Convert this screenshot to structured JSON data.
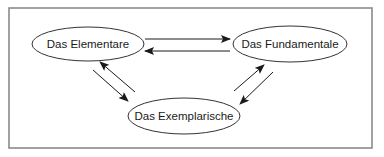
{
  "diagram": {
    "frame": {
      "x": 9,
      "y": 8,
      "width": 363,
      "height": 140,
      "stroke": "#8a8a8a"
    },
    "nodes": [
      {
        "id": "elementare",
        "label": "Das Elementare",
        "cx": 88,
        "cy": 44,
        "rx": 56,
        "ry": 17
      },
      {
        "id": "fundamentale",
        "label": "Das Fundamentale",
        "cx": 290,
        "cy": 44,
        "rx": 57,
        "ry": 18
      },
      {
        "id": "exemplarische",
        "label": "Das Exemplarische",
        "cx": 184,
        "cy": 116,
        "rx": 56,
        "ry": 18
      }
    ],
    "edges": [
      {
        "from": "elementare",
        "to": "fundamentale",
        "x1": 145,
        "y1": 39,
        "x2": 230,
        "y2": 39
      },
      {
        "from": "fundamentale",
        "to": "elementare",
        "x1": 230,
        "y1": 51,
        "x2": 145,
        "y2": 51
      },
      {
        "from": "elementare",
        "to": "exemplarische",
        "x1": 93,
        "y1": 70,
        "x2": 128,
        "y2": 101
      },
      {
        "from": "exemplarische",
        "to": "elementare",
        "x1": 135,
        "y1": 92,
        "x2": 100,
        "y2": 62
      },
      {
        "from": "exemplarische",
        "to": "fundamentale",
        "x1": 234,
        "y1": 91,
        "x2": 264,
        "y2": 65
      },
      {
        "from": "fundamentale",
        "to": "exemplarische",
        "x1": 273,
        "y1": 72,
        "x2": 240,
        "y2": 104
      }
    ],
    "colors": {
      "line": "#1a1a1a",
      "ellipse": "#333333",
      "frame": "#8a8a8a",
      "background": "#ffffff"
    }
  }
}
